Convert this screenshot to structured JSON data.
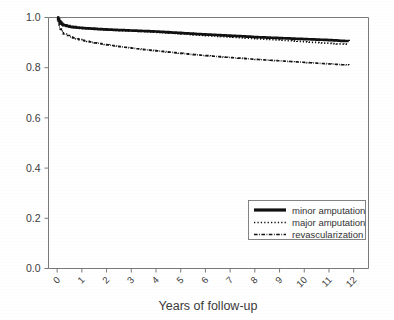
{
  "figure": {
    "title": "",
    "background_color": "#ffffff",
    "axis_color": "#7a7a7a",
    "curve_color": "#111111"
  },
  "axes": {
    "x_title": "Years of follow-up",
    "y_title": "",
    "x_ticks": [
      "0",
      "1",
      "2",
      "3",
      "4",
      "5",
      "6",
      "7",
      "8",
      "9",
      "10",
      "11",
      "12"
    ],
    "y_ticks": [
      "0.0",
      "0.2",
      "0.4",
      "0.6",
      "0.8",
      "1.0"
    ],
    "x_tick_rotation_deg": -45
  },
  "legend": {
    "position": "bottom-right",
    "entries": [
      {
        "label": "minor amputation",
        "style": "solid-thick"
      },
      {
        "label": "major amputation",
        "style": "dotted"
      },
      {
        "label": "revascularization",
        "style": "dash-dot"
      }
    ]
  },
  "chart_data": {
    "type": "line",
    "title": "",
    "subtitle": "",
    "xlabel": "Years of follow-up",
    "ylabel": "",
    "xlim": [
      -0.35,
      12.6
    ],
    "ylim": [
      0.0,
      1.0
    ],
    "xticks": [
      0,
      1,
      2,
      3,
      4,
      5,
      6,
      7,
      8,
      9,
      10,
      11,
      12
    ],
    "yticks": [
      0.0,
      0.2,
      0.4,
      0.6,
      0.8,
      1.0
    ],
    "grid": false,
    "legend_position": "lower right",
    "x": [
      0,
      0.08,
      0.17,
      0.25,
      0.5,
      0.75,
      1,
      1.5,
      2,
      2.5,
      3,
      3.5,
      4,
      4.5,
      5,
      5.5,
      6,
      6.5,
      7,
      7.5,
      8,
      8.5,
      9,
      9.5,
      10,
      10.5,
      11,
      11.5,
      11.8
    ],
    "series": [
      {
        "name": "minor amputation",
        "style": "solid-thick",
        "values": [
          1.0,
          0.985,
          0.975,
          0.969,
          0.963,
          0.96,
          0.958,
          0.955,
          0.952,
          0.95,
          0.948,
          0.946,
          0.944,
          0.941,
          0.938,
          0.935,
          0.932,
          0.93,
          0.927,
          0.925,
          0.922,
          0.92,
          0.918,
          0.916,
          0.914,
          0.912,
          0.91,
          0.907,
          0.906
        ]
      },
      {
        "name": "major amputation",
        "style": "dotted",
        "values": [
          1.0,
          0.982,
          0.972,
          0.966,
          0.961,
          0.958,
          0.956,
          0.953,
          0.95,
          0.948,
          0.946,
          0.944,
          0.941,
          0.938,
          0.935,
          0.931,
          0.928,
          0.925,
          0.922,
          0.919,
          0.916,
          0.913,
          0.91,
          0.907,
          0.903,
          0.9,
          0.897,
          0.894,
          0.893
        ]
      },
      {
        "name": "revascularization",
        "style": "dash-dot",
        "values": [
          1.0,
          0.962,
          0.945,
          0.934,
          0.923,
          0.915,
          0.909,
          0.899,
          0.891,
          0.884,
          0.878,
          0.872,
          0.867,
          0.862,
          0.857,
          0.852,
          0.848,
          0.844,
          0.84,
          0.837,
          0.833,
          0.83,
          0.827,
          0.824,
          0.821,
          0.818,
          0.815,
          0.812,
          0.811
        ]
      }
    ]
  }
}
